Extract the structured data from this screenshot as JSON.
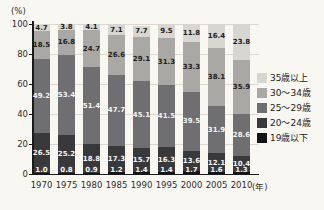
{
  "chart_data": {
    "type": "bar",
    "stacked": true,
    "title": "",
    "unit_label": "(%)",
    "x_unit_label": "(年)",
    "categories": [
      "1970",
      "1975",
      "1980",
      "1985",
      "1990",
      "1995",
      "2000",
      "2005",
      "2010"
    ],
    "series": [
      {
        "name": "19歳以下",
        "color": "#141416",
        "label_color": "#f5f5f3",
        "values": [
          1.0,
          0.8,
          0.9,
          1.2,
          1.4,
          1.4,
          1.7,
          1.6,
          1.3
        ]
      },
      {
        "name": "20〜24歳",
        "color": "#39393b",
        "label_color": "#f5f5f3",
        "values": [
          26.5,
          25.2,
          18.8,
          17.3,
          15.7,
          16.3,
          13.6,
          12.1,
          10.4
        ]
      },
      {
        "name": "25〜29歳",
        "color": "#6f6e70",
        "label_color": "#f5f5f3",
        "values": [
          49.2,
          53.4,
          51.4,
          47.7,
          45.1,
          41.5,
          39.5,
          31.9,
          28.6
        ]
      },
      {
        "name": "30〜34歳",
        "color": "#a9a8a4",
        "label_color": "#1c1c1c",
        "values": [
          18.5,
          16.8,
          24.7,
          26.6,
          29.1,
          31.3,
          33.3,
          38.1,
          35.9
        ]
      },
      {
        "name": "35歳以上",
        "color": "#d8d6d1",
        "label_color": "#1c1c1c",
        "values": [
          4.7,
          3.8,
          4.1,
          7.1,
          7.7,
          9.5,
          11.8,
          16.4,
          23.8
        ]
      }
    ],
    "ylim": [
      0,
      100
    ],
    "yticks": [
      0,
      20,
      40,
      60,
      80,
      100
    ],
    "grid": true,
    "legend": {
      "position": "right",
      "items": [
        "35歳以上",
        "30〜34歳",
        "25〜29歳",
        "20〜24歳",
        "19歳以下"
      ]
    }
  },
  "colors": {
    "background": "#f9f7f2",
    "gridline": "#dcd8d1",
    "axis": "#1a1a1a",
    "axis_text": "#2b2b2b"
  }
}
